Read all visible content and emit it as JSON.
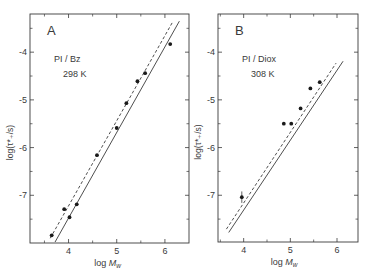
{
  "figure": {
    "background": "#ffffff",
    "ink_color": "#3a3a3a"
  },
  "chart_data": [
    {
      "type": "scatter",
      "panel_label": "A",
      "annotation_lines": [
        "PI / Bz",
        "298 K"
      ],
      "xlabel": "log M_w",
      "xlabel_main": "log ",
      "xlabel_var": "M",
      "xlabel_sub": "w",
      "ylabel": "log(τ*₊/s)",
      "xlim": [
        3.2,
        6.5
      ],
      "ylim": [
        -8.0,
        -3.2
      ],
      "xticks_major": [
        4,
        5,
        6
      ],
      "xticks_minor": [
        3.5,
        4.5,
        5.5
      ],
      "xtick_labels": [
        "4",
        "5",
        "6"
      ],
      "yticks_major": [
        -4,
        -5,
        -6,
        -7
      ],
      "yticks_minor": [
        -3.5,
        -4.5,
        -5.5,
        -6.5,
        -7.5
      ],
      "ytick_labels": [
        "-4",
        "-5",
        "-6",
        "-7"
      ],
      "grid": false,
      "legend": null,
      "points": [
        {
          "x": 3.65,
          "y": -7.84
        },
        {
          "x": 3.91,
          "y": -7.29
        },
        {
          "x": 4.02,
          "y": -7.46
        },
        {
          "x": 4.17,
          "y": -7.19
        },
        {
          "x": 4.59,
          "y": -6.16
        },
        {
          "x": 5.0,
          "y": -5.59
        },
        {
          "x": 5.2,
          "y": -5.07
        },
        {
          "x": 5.43,
          "y": -4.61
        },
        {
          "x": 5.59,
          "y": -4.44
        },
        {
          "x": 6.11,
          "y": -3.83
        }
      ],
      "lines": [
        {
          "name": "solid",
          "style": "solid",
          "x": [
            3.72,
            6.3
          ],
          "y": [
            -7.98,
            -3.35
          ]
        },
        {
          "name": "dashed",
          "style": "dashed",
          "x": [
            3.62,
            6.17
          ],
          "y": [
            -7.9,
            -3.35
          ]
        }
      ],
      "frame_px": {
        "left": 30,
        "top": 14,
        "right": 189,
        "bottom": 243
      }
    },
    {
      "type": "scatter",
      "panel_label": "B",
      "annotation_lines": [
        "PI / Diox",
        "308 K"
      ],
      "xlabel": "log M_w",
      "xlabel_main": "log ",
      "xlabel_var": "M",
      "xlabel_sub": "w",
      "ylabel": "log(τ*₊/s)",
      "xlim": [
        3.45,
        6.45
      ],
      "ylim": [
        -7.98,
        -3.2
      ],
      "xticks_major": [
        4,
        5,
        6
      ],
      "xticks_minor": [
        3.5,
        4.5,
        5.5
      ],
      "xtick_labels": [
        "4",
        "5",
        "6"
      ],
      "yticks_major": [
        -4,
        -5,
        -6,
        -7
      ],
      "yticks_minor": [
        -3.5,
        -4.5,
        -5.5,
        -6.5,
        -7.5
      ],
      "ytick_labels": [
        "-4",
        "-5",
        "-6",
        "-7"
      ],
      "grid": false,
      "legend": null,
      "points": [
        {
          "x": 3.96,
          "y": -7.04,
          "yerr": 0.12
        },
        {
          "x": 4.86,
          "y": -5.5
        },
        {
          "x": 5.02,
          "y": -5.5
        },
        {
          "x": 5.22,
          "y": -5.18
        },
        {
          "x": 5.43,
          "y": -4.76
        },
        {
          "x": 5.63,
          "y": -4.63
        }
      ],
      "lines": [
        {
          "name": "solid",
          "style": "solid",
          "x": [
            3.68,
            6.13
          ],
          "y": [
            -7.78,
            -4.19
          ]
        },
        {
          "name": "dashed",
          "style": "dashed",
          "x": [
            3.63,
            5.98
          ],
          "y": [
            -7.71,
            -4.23
          ]
        }
      ],
      "frame_px": {
        "left": 218,
        "top": 14,
        "right": 358,
        "bottom": 242
      }
    }
  ]
}
